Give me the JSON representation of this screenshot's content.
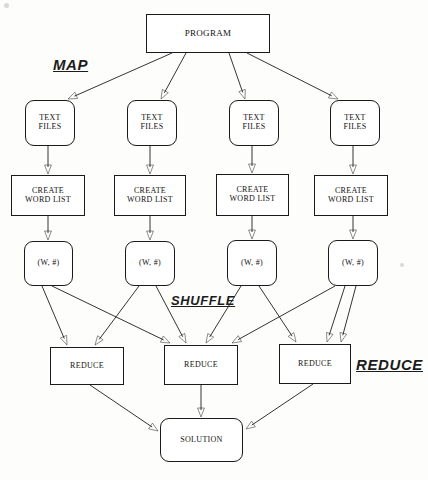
{
  "diagram": {
    "background_color": "#fdfdfc",
    "stroke_color": "#1d1d1d",
    "stage_labels": [
      {
        "name": "map",
        "text": "MAP",
        "x": 53,
        "y": 56,
        "font_size": 15
      },
      {
        "name": "shuffle",
        "text": "SHUFFLE",
        "x": 171,
        "y": 293,
        "font_size": 13
      },
      {
        "name": "reduce",
        "text": "REDUCE",
        "x": 356,
        "y": 356,
        "font_size": 15
      }
    ],
    "nodes": [
      {
        "id": "program",
        "name": "program-node",
        "label": "PROGRAM",
        "x": 146,
        "y": 14,
        "w": 124,
        "h": 39,
        "shape": "rect",
        "font_size": 9
      },
      {
        "id": "text1",
        "name": "text-files-node-1",
        "label": "TEXT\nFILES",
        "x": 25,
        "y": 100,
        "w": 50,
        "h": 46,
        "shape": "rounded",
        "font_size": 8
      },
      {
        "id": "text2",
        "name": "text-files-node-2",
        "label": "TEXT\nFILES",
        "x": 127,
        "y": 100,
        "w": 50,
        "h": 46,
        "shape": "rounded",
        "font_size": 8
      },
      {
        "id": "text3",
        "name": "text-files-node-3",
        "label": "TEXT\nFILES",
        "x": 229,
        "y": 100,
        "w": 50,
        "h": 46,
        "shape": "rounded",
        "font_size": 8
      },
      {
        "id": "text4",
        "name": "text-files-node-4",
        "label": "TEXT\nFILES",
        "x": 330,
        "y": 100,
        "w": 50,
        "h": 46,
        "shape": "rounded",
        "font_size": 8
      },
      {
        "id": "cwl1",
        "name": "create-word-list-node-1",
        "label": "CREATE\nWORD LIST",
        "x": 11,
        "y": 175,
        "w": 74,
        "h": 41,
        "shape": "rect",
        "font_size": 8
      },
      {
        "id": "cwl2",
        "name": "create-word-list-node-2",
        "label": "CREATE\nWORD LIST",
        "x": 114,
        "y": 175,
        "w": 72,
        "h": 41,
        "shape": "rect",
        "font_size": 8
      },
      {
        "id": "cwl3",
        "name": "create-word-list-node-3",
        "label": "CREATE\nWORD LIST",
        "x": 216,
        "y": 174,
        "w": 73,
        "h": 42,
        "shape": "rect",
        "font_size": 8
      },
      {
        "id": "cwl4",
        "name": "create-word-list-node-4",
        "label": "CREATE\nWORD LIST",
        "x": 314,
        "y": 175,
        "w": 74,
        "h": 41,
        "shape": "rect",
        "font_size": 8
      },
      {
        "id": "pair1",
        "name": "word-count-pair-node-1",
        "label": "(W, #)",
        "x": 24,
        "y": 241,
        "w": 49,
        "h": 45,
        "shape": "rounded",
        "font_size": 8
      },
      {
        "id": "pair2",
        "name": "word-count-pair-node-2",
        "label": "(W, #)",
        "x": 125,
        "y": 241,
        "w": 50,
        "h": 45,
        "shape": "rounded",
        "font_size": 8
      },
      {
        "id": "pair3",
        "name": "word-count-pair-node-3",
        "label": "(W, #)",
        "x": 227,
        "y": 240,
        "w": 50,
        "h": 46,
        "shape": "rounded",
        "font_size": 8
      },
      {
        "id": "pair4",
        "name": "word-count-pair-node-4",
        "label": "(W, #)",
        "x": 328,
        "y": 240,
        "w": 50,
        "h": 46,
        "shape": "rounded",
        "font_size": 8
      },
      {
        "id": "reduce1",
        "name": "reduce-node-1",
        "label": "REDUCE",
        "x": 50,
        "y": 347,
        "w": 74,
        "h": 38,
        "shape": "rect",
        "font_size": 8
      },
      {
        "id": "reduce2",
        "name": "reduce-node-2",
        "label": "REDUCE",
        "x": 164,
        "y": 345,
        "w": 74,
        "h": 40,
        "shape": "rect",
        "font_size": 8
      },
      {
        "id": "reduce3",
        "name": "reduce-node-3",
        "label": "REDUCE",
        "x": 279,
        "y": 344,
        "w": 72,
        "h": 40,
        "shape": "rect",
        "font_size": 8
      },
      {
        "id": "solution",
        "name": "solution-node",
        "label": "SOLUTION",
        "x": 160,
        "y": 418,
        "w": 83,
        "h": 44,
        "shape": "rounded",
        "font_size": 8
      }
    ],
    "edges": [
      {
        "name": "edge-program-to-text1",
        "from": "program",
        "to": "text1",
        "x1": 172,
        "y1": 53,
        "x2": 68,
        "y2": 99,
        "arrow": true
      },
      {
        "name": "edge-program-to-text2",
        "from": "program",
        "to": "text2",
        "x1": 186,
        "y1": 53,
        "x2": 161,
        "y2": 99,
        "arrow": true
      },
      {
        "name": "edge-program-to-text3",
        "from": "program",
        "to": "text3",
        "x1": 229,
        "y1": 53,
        "x2": 245,
        "y2": 99,
        "arrow": true
      },
      {
        "name": "edge-program-to-text4",
        "from": "program",
        "to": "text4",
        "x1": 247,
        "y1": 53,
        "x2": 338,
        "y2": 99,
        "arrow": true
      },
      {
        "name": "edge-text1-to-cwl1",
        "from": "text1",
        "to": "cwl1",
        "x1": 48,
        "y1": 146,
        "x2": 48,
        "y2": 174,
        "arrow": true
      },
      {
        "name": "edge-text2-to-cwl2",
        "from": "text2",
        "to": "cwl2",
        "x1": 150,
        "y1": 146,
        "x2": 150,
        "y2": 174,
        "arrow": true
      },
      {
        "name": "edge-text3-to-cwl3",
        "from": "text3",
        "to": "cwl3",
        "x1": 252,
        "y1": 146,
        "x2": 252,
        "y2": 173,
        "arrow": true
      },
      {
        "name": "edge-text4-to-cwl4",
        "from": "text4",
        "to": "cwl4",
        "x1": 353,
        "y1": 146,
        "x2": 353,
        "y2": 174,
        "arrow": true
      },
      {
        "name": "edge-cwl1-to-pair1",
        "from": "cwl1",
        "to": "pair1",
        "x1": 48,
        "y1": 216,
        "x2": 48,
        "y2": 240,
        "arrow": true
      },
      {
        "name": "edge-cwl2-to-pair2",
        "from": "cwl2",
        "to": "pair2",
        "x1": 150,
        "y1": 216,
        "x2": 150,
        "y2": 240,
        "arrow": true
      },
      {
        "name": "edge-cwl3-to-pair3",
        "from": "cwl3",
        "to": "pair3",
        "x1": 252,
        "y1": 216,
        "x2": 252,
        "y2": 239,
        "arrow": true
      },
      {
        "name": "edge-cwl4-to-pair4",
        "from": "cwl4",
        "to": "pair4",
        "x1": 353,
        "y1": 216,
        "x2": 353,
        "y2": 239,
        "arrow": true
      },
      {
        "name": "edge-pair1-to-reduce1",
        "from": "pair1",
        "to": "reduce1",
        "x1": 42,
        "y1": 286,
        "x2": 67,
        "y2": 345,
        "arrow": true
      },
      {
        "name": "edge-pair1-to-reduce2",
        "from": "pair1",
        "to": "reduce2",
        "x1": 52,
        "y1": 286,
        "x2": 170,
        "y2": 343,
        "arrow": true
      },
      {
        "name": "edge-pair2-to-reduce1",
        "from": "pair2",
        "to": "reduce1",
        "x1": 139,
        "y1": 286,
        "x2": 95,
        "y2": 345,
        "arrow": true
      },
      {
        "name": "edge-pair2-to-reduce2",
        "from": "pair2",
        "to": "reduce2",
        "x1": 156,
        "y1": 286,
        "x2": 186,
        "y2": 343,
        "arrow": true
      },
      {
        "name": "edge-pair3-to-reduce2",
        "from": "pair3",
        "to": "reduce2",
        "x1": 241,
        "y1": 286,
        "x2": 206,
        "y2": 343,
        "arrow": true
      },
      {
        "name": "edge-pair3-to-reduce3",
        "from": "pair3",
        "to": "reduce3",
        "x1": 259,
        "y1": 286,
        "x2": 296,
        "y2": 342,
        "arrow": true
      },
      {
        "name": "edge-pair4-to-reduce2",
        "from": "pair4",
        "to": "reduce2",
        "x1": 335,
        "y1": 286,
        "x2": 232,
        "y2": 343,
        "arrow": true
      },
      {
        "name": "edge-pair4-to-reduce3",
        "from": "pair4",
        "to": "reduce3",
        "x1": 345,
        "y1": 286,
        "x2": 327,
        "y2": 342,
        "arrow": true
      },
      {
        "name": "edge-pair4-to-reduce3-b",
        "from": "pair4",
        "to": "reduce3",
        "x1": 356,
        "y1": 286,
        "x2": 341,
        "y2": 342,
        "arrow": true
      },
      {
        "name": "edge-reduce1-to-solution",
        "from": "reduce1",
        "to": "solution",
        "x1": 90,
        "y1": 385,
        "x2": 158,
        "y2": 431,
        "arrow": true
      },
      {
        "name": "edge-reduce2-to-solution",
        "from": "reduce2",
        "to": "solution",
        "x1": 201,
        "y1": 385,
        "x2": 201,
        "y2": 417,
        "arrow": true
      },
      {
        "name": "edge-reduce3-to-solution",
        "from": "reduce3",
        "to": "solution",
        "x1": 313,
        "y1": 384,
        "x2": 246,
        "y2": 429,
        "arrow": true
      }
    ]
  }
}
